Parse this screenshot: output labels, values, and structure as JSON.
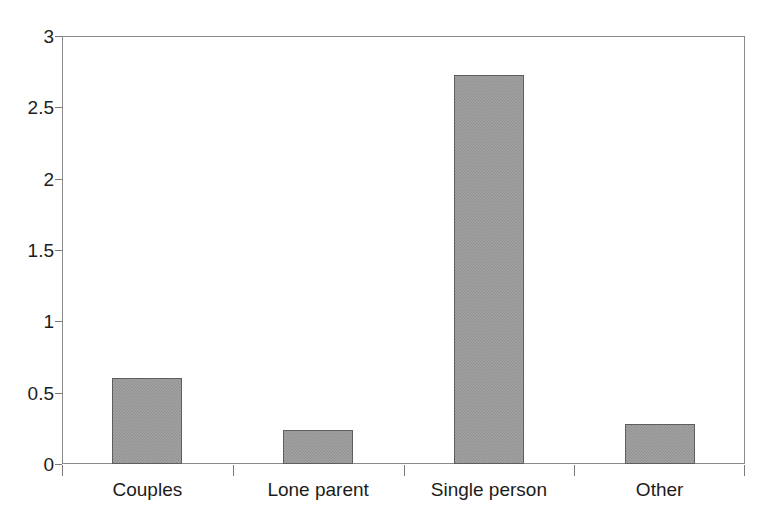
{
  "chart_data": {
    "type": "bar",
    "title": "",
    "subtitle": "",
    "xlabel": "",
    "ylabel": "",
    "categories": [
      "Couples",
      "Lone parent",
      "Single person",
      "Other"
    ],
    "values": [
      0.6,
      0.24,
      2.73,
      0.28
    ],
    "series": [
      {
        "name": "",
        "values": [
          0.6,
          0.24,
          2.73,
          0.28
        ]
      }
    ],
    "ylim": [
      0,
      3
    ],
    "ytick_labels": [
      "0",
      "0.5",
      "1",
      "1.5",
      "2",
      "2.5",
      "3"
    ],
    "ytick_values": [
      0,
      0.5,
      1,
      1.5,
      2,
      2.5,
      3
    ],
    "grid": false,
    "legend": null,
    "legend_position": "none",
    "bar_fill_color": "#a3a3a3",
    "bar_border_color": "#5e5e5e",
    "axis_color": "#8a8a8a",
    "text_color": "#1c1c1c",
    "background_color": "#ffffff",
    "annotations": []
  },
  "caption": {
    "text": ""
  }
}
